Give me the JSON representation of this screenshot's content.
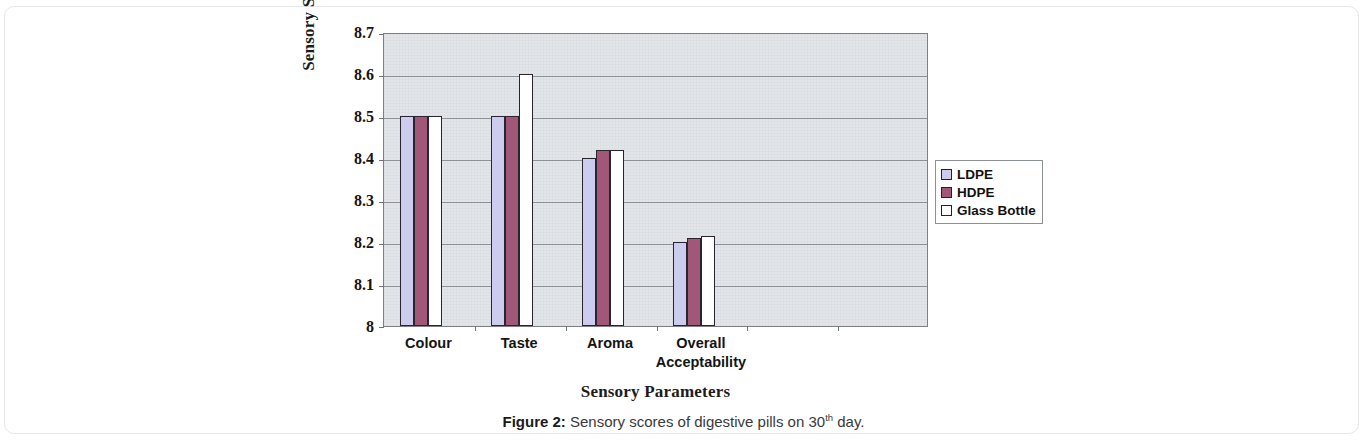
{
  "figure": {
    "caption_label": "Figure 2:",
    "caption_text_before": " Sensory scores of digestive pills on 30",
    "caption_superscript": "th",
    "caption_text_after": " day."
  },
  "legend": {
    "position": "right",
    "entries": [
      {
        "label": "LDPE",
        "color": "#ccccee"
      },
      {
        "label": "HDPE",
        "color": "#a15878"
      },
      {
        "label": "Glass Bottle",
        "color": "#ffffff"
      }
    ]
  },
  "chart_data": {
    "type": "bar",
    "title": "",
    "xlabel": "Sensory Parameters",
    "ylabel": "Sensory Scores",
    "categories": [
      "Colour",
      "Taste",
      "Aroma",
      "Overall Acceptability"
    ],
    "category_lines": [
      [
        "Colour"
      ],
      [
        "Taste"
      ],
      [
        "Aroma"
      ],
      [
        "Overall",
        "Acceptability"
      ]
    ],
    "series": [
      {
        "name": "LDPE",
        "color": "#ccccee",
        "values": [
          8.5,
          8.5,
          8.4,
          8.2
        ]
      },
      {
        "name": "HDPE",
        "color": "#a15878",
        "values": [
          8.5,
          8.5,
          8.42,
          8.21
        ]
      },
      {
        "name": "Glass Bottle",
        "color": "#ffffff",
        "values": [
          8.5,
          8.6,
          8.42,
          8.215
        ]
      }
    ],
    "ylim": [
      8,
      8.7
    ],
    "yticks": [
      "8",
      "8.1",
      "8.2",
      "8.3",
      "8.4",
      "8.5",
      "8.6",
      "8.7"
    ],
    "ytick_values": [
      8,
      8.1,
      8.2,
      8.3,
      8.4,
      8.5,
      8.6,
      8.7
    ],
    "grid": true,
    "grid_axis": "y",
    "xtick_slots": 6,
    "plot_background": "#e3e6e9"
  }
}
